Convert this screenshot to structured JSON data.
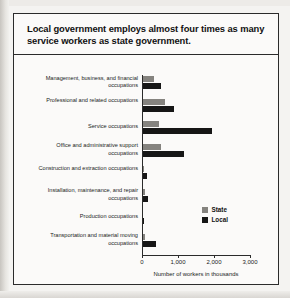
{
  "figure": {
    "title": "Local government employs almost four times as many service workers as state government."
  },
  "legend": {
    "items": [
      {
        "label": "State",
        "color": "#85837f"
      },
      {
        "label": "Local",
        "color": "#161616"
      }
    ]
  },
  "axis": {
    "x_title": "Number of workers in thousands",
    "ticks": [
      "0",
      "1,000",
      "2,000",
      "3,000"
    ]
  },
  "chart_data": {
    "type": "bar",
    "orientation": "horizontal",
    "title": "Local government employs almost four times as many service workers as state government.",
    "xlabel": "Number of workers in thousands",
    "ylabel": "",
    "xlim": [
      0,
      3000
    ],
    "xticks": [
      0,
      1000,
      2000,
      3000
    ],
    "xticklabels": [
      "0",
      "1,000",
      "2,000",
      "3,000"
    ],
    "grid": false,
    "legend_position": "inside-right-lower",
    "categories": [
      "Management, business, and financial occupations",
      "Professional and related occupations",
      "Service occupations",
      "Office and administrative support occupations",
      "Construction and extraction occupations",
      "Installation, maintenance, and repair occupations",
      "Production occupations",
      "Transportation and material moving occupations"
    ],
    "series": [
      {
        "name": "State",
        "color": "#85837f",
        "values": [
          330,
          650,
          480,
          540,
          60,
          90,
          40,
          90
        ]
      },
      {
        "name": "Local",
        "color": "#161616",
        "values": [
          520,
          900,
          1950,
          1180,
          130,
          180,
          60,
          400
        ]
      }
    ]
  }
}
